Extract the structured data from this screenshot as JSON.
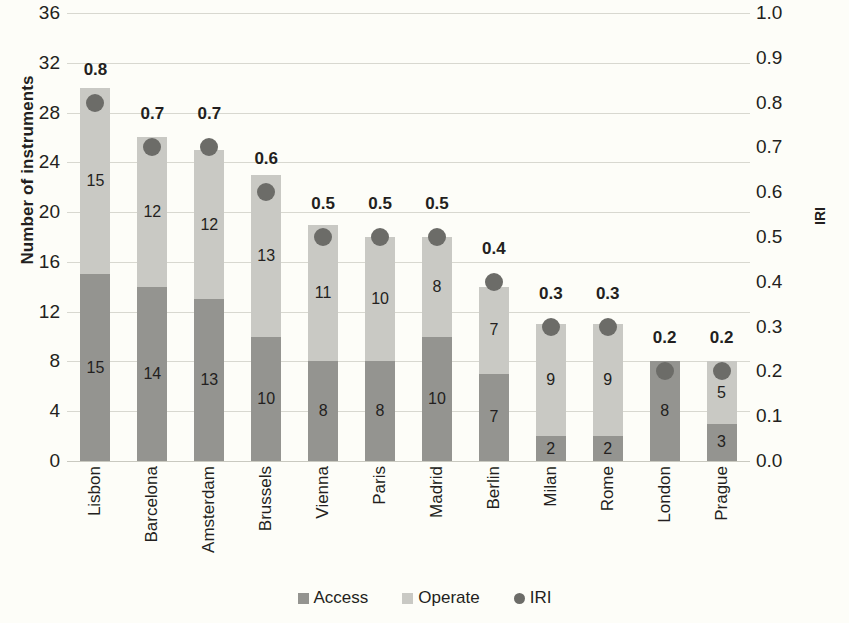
{
  "chart_data": {
    "type": "bar",
    "title": "",
    "subtitle": "",
    "xlabel": "",
    "ylabel": "Number of instruments",
    "y2label": "IRI",
    "ylim": [
      0,
      36
    ],
    "y2lim": [
      0.0,
      1.0
    ],
    "ytick_step": 4,
    "y2tick_step": 0.1,
    "grid": true,
    "stacked": true,
    "legend_position": "bottom",
    "categories": [
      "Lisbon",
      "Barcelona",
      "Amsterdam",
      "Brussels",
      "Vienna",
      "Paris",
      "Madrid",
      "Berlin",
      "Milan",
      "Rome",
      "London",
      "Prague"
    ],
    "yticks": [
      "36",
      "32",
      "28",
      "24",
      "20",
      "16",
      "12",
      "8",
      "4",
      "0"
    ],
    "y2ticks": [
      "1.0",
      "0.9",
      "0.8",
      "0.7",
      "0.6",
      "0.5",
      "0.4",
      "0.3",
      "0.2",
      "0.1",
      "0.0"
    ],
    "series": [
      {
        "name": "Access",
        "color": "#949490",
        "values": [
          15,
          14,
          13,
          10,
          8,
          8,
          10,
          7,
          2,
          2,
          8,
          3
        ]
      },
      {
        "name": "Operate",
        "color": "#c9c9c4",
        "values": [
          15,
          12,
          12,
          13,
          11,
          10,
          8,
          7,
          9,
          9,
          0,
          5
        ]
      },
      {
        "name": "IRI",
        "color": "#6c6c68",
        "axis": "secondary",
        "values": [
          0.8,
          0.7,
          0.7,
          0.6,
          0.5,
          0.5,
          0.5,
          0.4,
          0.3,
          0.3,
          0.2,
          0.2
        ],
        "labels": [
          "0.8",
          "0.7",
          "0.7",
          "0.6",
          "0.5",
          "0.5",
          "0.5",
          "0.4",
          "0.3",
          "0.3",
          "0.2",
          "0.2"
        ]
      }
    ],
    "totals": [
      30,
      26,
      25,
      23,
      19,
      18,
      18,
      14,
      11,
      11,
      8,
      8
    ]
  },
  "legend": {
    "items": [
      {
        "label": "Access",
        "marker": "square-dark",
        "color": "#949490"
      },
      {
        "label": "Operate",
        "marker": "square-light",
        "color": "#c9c9c4"
      },
      {
        "label": "IRI",
        "marker": "circle-dark",
        "color": "#6c6c68"
      }
    ]
  }
}
